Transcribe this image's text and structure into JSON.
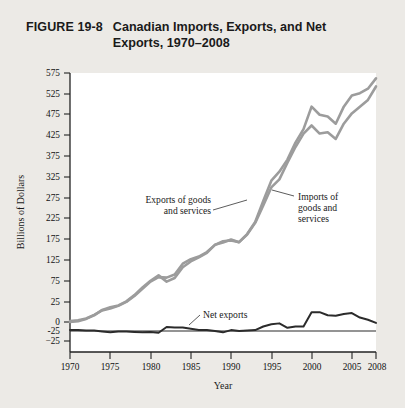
{
  "figure": {
    "number": "FIGURE 19-8",
    "title": "Canadian Imports, Exports, and Net Exports, 1970–2008"
  },
  "annotations": {
    "exports_label_line1": "Exports of goods",
    "exports_label_line2": "and services",
    "imports_label_line1": "Imports of",
    "imports_label_line2": "goods and",
    "imports_label_line3": "services",
    "net_exports_label": "Net exports"
  },
  "colors": {
    "page_background": "#eceae6",
    "plot_background": "#ffffff",
    "gray_series": "#9c9c9c",
    "dark_series": "#2b2b2b",
    "axis": "#222222"
  },
  "chart_data": {
    "type": "line",
    "title": "Canadian Imports, Exports, and Net Exports, 1970–2008",
    "xlabel": "Year",
    "ylabel": "Billions of Dollars",
    "xlim": [
      1970,
      2008
    ],
    "ylim": [
      -25,
      575
    ],
    "grid": false,
    "legend": "inline-annotations",
    "xticks": [
      1970,
      1975,
      1980,
      1985,
      1990,
      1995,
      2000,
      2005,
      2008
    ],
    "xtick_labels": [
      "1970",
      "1975",
      "1980",
      "1985",
      "1990",
      "1995",
      "2000",
      "2005",
      "2008"
    ],
    "yticks": [
      -25,
      0,
      25,
      75,
      125,
      175,
      225,
      275,
      325,
      375,
      425,
      475,
      525,
      575
    ],
    "ytick_labels": [
      "-25",
      "0",
      "25",
      "75",
      "125",
      "175",
      "225",
      "275",
      "325",
      "375",
      "425",
      "475",
      "525",
      "575"
    ],
    "x": [
      1970,
      1971,
      1972,
      1973,
      1974,
      1975,
      1976,
      1977,
      1978,
      1979,
      1980,
      1981,
      1982,
      1983,
      1984,
      1985,
      1986,
      1987,
      1988,
      1989,
      1990,
      1991,
      1992,
      1993,
      1994,
      1995,
      1996,
      1997,
      1998,
      1999,
      2000,
      2001,
      2002,
      2003,
      2004,
      2005,
      2006,
      2007,
      2008
    ],
    "series": [
      {
        "name": "Exports of goods and services",
        "color": "#9c9c9c",
        "values": [
          22,
          24,
          28,
          36,
          46,
          50,
          56,
          65,
          78,
          94,
          110,
          120,
          119,
          126,
          150,
          160,
          166,
          176,
          192,
          197,
          204,
          198,
          216,
          243,
          290,
          335,
          355,
          382,
          420,
          450,
          500,
          482,
          478,
          462,
          500,
          525,
          530,
          540,
          563
        ]
      },
      {
        "name": "Imports of goods and services",
        "color": "#9c9c9c",
        "values": [
          20,
          22,
          27,
          35,
          47,
          53,
          57,
          66,
          80,
          97,
          112,
          124,
          110,
          118,
          142,
          155,
          164,
          174,
          192,
          200,
          202,
          198,
          215,
          241,
          280,
          320,
          338,
          375,
          410,
          440,
          458,
          440,
          443,
          428,
          462,
          485,
          500,
          515,
          545
        ]
      },
      {
        "name": "Net exports",
        "color": "#2b2b2b",
        "values": [
          2,
          2,
          1,
          1,
          -1,
          -3,
          -1,
          -1,
          -2,
          -3,
          -2,
          -4,
          9,
          8,
          8,
          5,
          2,
          2,
          0,
          -3,
          2,
          0,
          1,
          2,
          10,
          15,
          17,
          7,
          10,
          10,
          42,
          42,
          35,
          34,
          38,
          40,
          30,
          25,
          18
        ]
      }
    ]
  }
}
